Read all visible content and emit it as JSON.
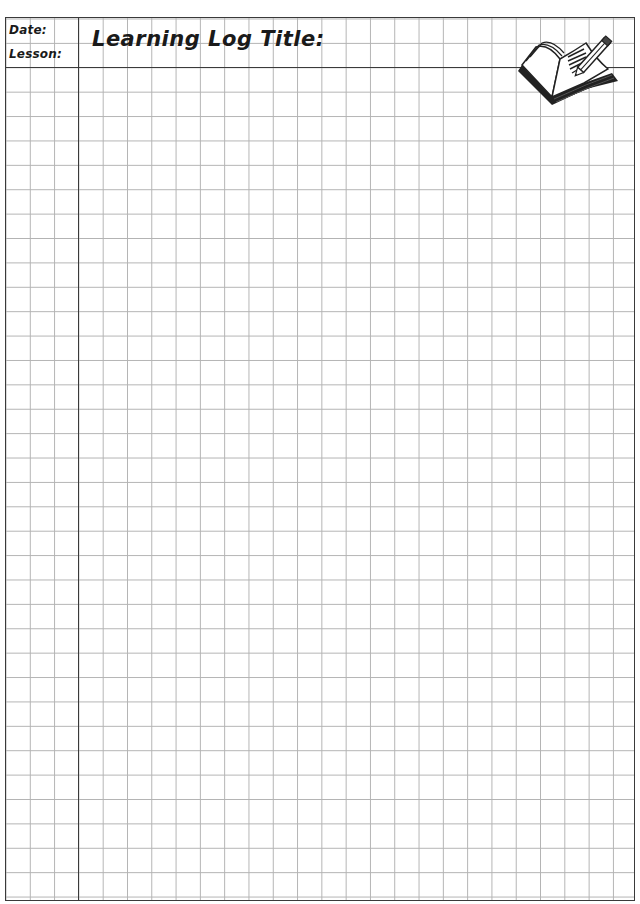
{
  "header": {
    "date_label": "Date:",
    "lesson_label": "Lesson:",
    "title_label": "Learning Log Title:"
  },
  "icons": {
    "book_icon": "open-book-with-pencil-icon"
  },
  "grid": {
    "cell_size_px": 24,
    "line_color": "#b3b3b3",
    "border_color": "#3a3a3a",
    "margin_columns": 3
  }
}
